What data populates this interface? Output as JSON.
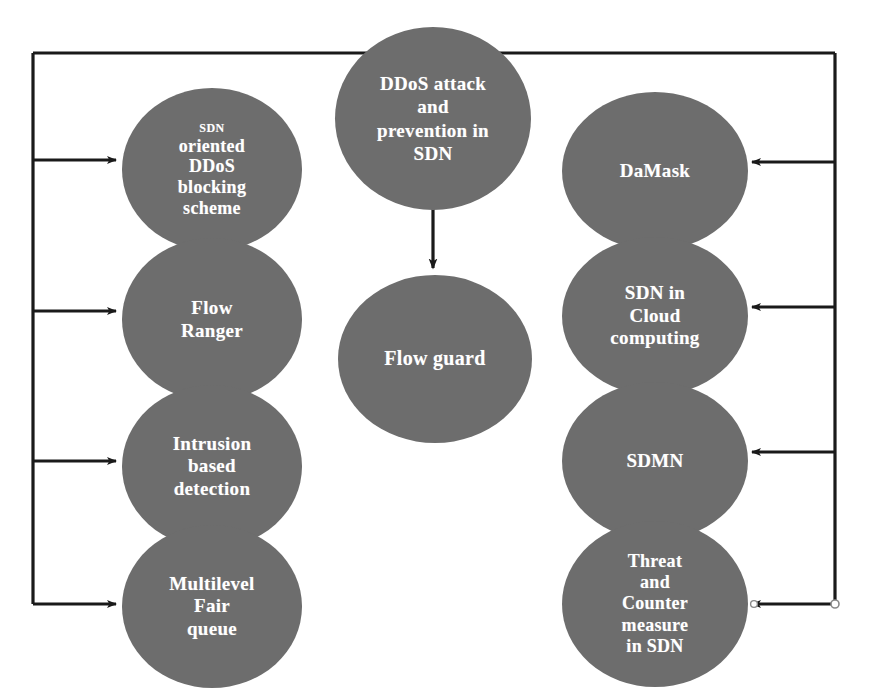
{
  "diagram": {
    "title": "DDoS attack and prevention in SDN",
    "node_fill_color": "#6d6d6d",
    "node_text_color": "#ffffff",
    "connector_color": "#1a1a1a",
    "background_color": "#ffffff"
  },
  "center": {
    "hub_label": "DDoS attack\nand\nprevention in\nSDN",
    "hub_label_lines": [
      "DDoS attack",
      "and",
      "prevention in",
      "SDN"
    ],
    "child_label": "Flow guard"
  },
  "left_branch": {
    "nodes": [
      {
        "id": "sdn-oriented-ddos-blocking-scheme",
        "small_first_line": "SDN",
        "label": "oriented\nDDoS\nblocking\nscheme",
        "full_text": "SDN oriented DDoS blocking scheme"
      },
      {
        "id": "flow-ranger",
        "label": "Flow\nRanger",
        "full_text": "Flow Ranger"
      },
      {
        "id": "intrusion-based-detection",
        "label": "Intrusion\nbased\ndetection",
        "full_text": "Intrusion based detection"
      },
      {
        "id": "multilevel-fair-queue",
        "label": "Multilevel\nFair\nqueue",
        "full_text": "Multilevel Fair queue"
      }
    ]
  },
  "right_branch": {
    "nodes": [
      {
        "id": "damask",
        "label": "DaMask",
        "full_text": "DaMask"
      },
      {
        "id": "sdn-in-cloud-computing",
        "label": "SDN  in\nCloud\ncomputing",
        "full_text": "SDN in Cloud computing"
      },
      {
        "id": "sdmn",
        "label": "SDMN",
        "full_text": "SDMN"
      },
      {
        "id": "threat-and-counter-measure-in-sdn",
        "label": "Threat\nand\nCounter\nmeasure\nin SDN",
        "full_text": "Threat and Counter measure in SDN"
      }
    ]
  },
  "connectors": {
    "left_bus_label": "left-distribution-bus",
    "right_bus_label": "right-distribution-bus",
    "center_arrow_label": "hub-to-flow-guard-arrow",
    "left_arrow_count": 4,
    "right_arrow_count": 4
  }
}
